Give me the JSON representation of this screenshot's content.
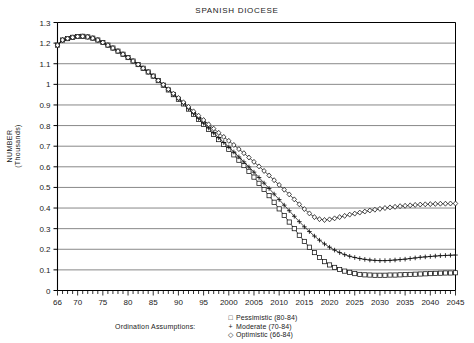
{
  "chart_data": {
    "type": "line",
    "title": "SPANISH DIOCESE",
    "xlabel": "",
    "ylabel": "NUMBER (Thousands)",
    "ylabel_line1": "NUMBER",
    "ylabel_line2": "(Thousands)",
    "grid": true,
    "legend_position": "below",
    "legend_title": "Ordination Assumptions:",
    "xlim": [
      1966,
      2045
    ],
    "ylim": [
      0,
      1.3
    ],
    "yticks": [
      "1.3",
      "1.2",
      "1.1",
      "1",
      "0.9",
      "0.8",
      "0.7",
      "0.6",
      "0.5",
      "0.4",
      "0.3",
      "0.2",
      "0.1",
      "0"
    ],
    "ytick_values": [
      1.3,
      1.2,
      1.1,
      1.0,
      0.9,
      0.8,
      0.7,
      0.6,
      0.5,
      0.4,
      0.3,
      0.2,
      0.1,
      0
    ],
    "xticks": [
      "66",
      "70",
      "75",
      "80",
      "85",
      "90",
      "95",
      "2000",
      "2005",
      "2010",
      "2015",
      "2020",
      "2025",
      "2030",
      "2035",
      "2040",
      "2045"
    ],
    "xtick_values": [
      1966,
      1970,
      1975,
      1980,
      1985,
      1990,
      1995,
      2000,
      2005,
      2010,
      2015,
      2020,
      2025,
      2030,
      2035,
      2040,
      2045
    ],
    "x": [
      1966,
      1967,
      1968,
      1969,
      1970,
      1971,
      1972,
      1973,
      1974,
      1975,
      1976,
      1977,
      1978,
      1979,
      1980,
      1981,
      1982,
      1983,
      1984,
      1985,
      1986,
      1987,
      1988,
      1989,
      1990,
      1991,
      1992,
      1993,
      1994,
      1995,
      1996,
      1997,
      1998,
      1999,
      2000,
      2001,
      2002,
      2003,
      2004,
      2005,
      2006,
      2007,
      2008,
      2009,
      2010,
      2011,
      2012,
      2013,
      2014,
      2015,
      2016,
      2017,
      2018,
      2019,
      2020,
      2021,
      2022,
      2023,
      2024,
      2025,
      2026,
      2027,
      2028,
      2029,
      2030,
      2031,
      2032,
      2033,
      2034,
      2035,
      2036,
      2037,
      2038,
      2039,
      2040,
      2041,
      2042,
      2043,
      2044,
      2045
    ],
    "series": [
      {
        "name": "Pessimistic (80-84)",
        "marker": "square",
        "values": [
          1.19,
          1.215,
          1.222,
          1.228,
          1.232,
          1.233,
          1.23,
          1.224,
          1.215,
          1.203,
          1.19,
          1.176,
          1.161,
          1.146,
          1.13,
          1.113,
          1.096,
          1.078,
          1.06,
          1.04,
          1.018,
          0.996,
          0.973,
          0.95,
          0.928,
          0.905,
          0.88,
          0.855,
          0.83,
          0.806,
          0.782,
          0.757,
          0.732,
          0.708,
          0.684,
          0.658,
          0.632,
          0.606,
          0.578,
          0.55,
          0.52,
          0.49,
          0.46,
          0.428,
          0.396,
          0.364,
          0.332,
          0.3,
          0.268,
          0.238,
          0.21,
          0.184,
          0.16,
          0.14,
          0.124,
          0.112,
          0.102,
          0.094,
          0.088,
          0.082,
          0.078,
          0.076,
          0.075,
          0.074,
          0.074,
          0.074,
          0.075,
          0.075,
          0.076,
          0.077,
          0.078,
          0.079,
          0.08,
          0.081,
          0.082,
          0.083,
          0.084,
          0.085,
          0.085,
          0.086
        ]
      },
      {
        "name": "Moderate (70-84)",
        "marker": "plus",
        "values": [
          1.19,
          1.215,
          1.222,
          1.228,
          1.232,
          1.233,
          1.23,
          1.224,
          1.215,
          1.203,
          1.19,
          1.176,
          1.161,
          1.146,
          1.13,
          1.113,
          1.096,
          1.078,
          1.06,
          1.04,
          1.018,
          0.996,
          0.973,
          0.95,
          0.928,
          0.906,
          0.882,
          0.858,
          0.834,
          0.811,
          0.788,
          0.764,
          0.741,
          0.718,
          0.696,
          0.672,
          0.648,
          0.624,
          0.599,
          0.574,
          0.548,
          0.521,
          0.495,
          0.468,
          0.441,
          0.414,
          0.387,
          0.36,
          0.334,
          0.309,
          0.286,
          0.264,
          0.244,
          0.226,
          0.21,
          0.196,
          0.184,
          0.174,
          0.166,
          0.16,
          0.155,
          0.151,
          0.148,
          0.146,
          0.145,
          0.145,
          0.146,
          0.148,
          0.15,
          0.152,
          0.155,
          0.158,
          0.161,
          0.163,
          0.165,
          0.167,
          0.169,
          0.17,
          0.171,
          0.172
        ]
      },
      {
        "name": "Optimistic (66-84)",
        "marker": "diamond",
        "values": [
          1.19,
          1.215,
          1.222,
          1.228,
          1.232,
          1.233,
          1.23,
          1.224,
          1.215,
          1.203,
          1.19,
          1.176,
          1.161,
          1.146,
          1.13,
          1.113,
          1.096,
          1.078,
          1.06,
          1.04,
          1.019,
          0.998,
          0.976,
          0.955,
          0.934,
          0.913,
          0.891,
          0.869,
          0.848,
          0.827,
          0.806,
          0.785,
          0.765,
          0.745,
          0.726,
          0.706,
          0.686,
          0.666,
          0.645,
          0.624,
          0.602,
          0.58,
          0.558,
          0.535,
          0.512,
          0.489,
          0.466,
          0.442,
          0.418,
          0.395,
          0.374,
          0.356,
          0.346,
          0.342,
          0.345,
          0.35,
          0.356,
          0.362,
          0.368,
          0.373,
          0.378,
          0.383,
          0.388,
          0.392,
          0.396,
          0.4,
          0.403,
          0.406,
          0.409,
          0.411,
          0.413,
          0.415,
          0.417,
          0.418,
          0.419,
          0.42,
          0.421,
          0.421,
          0.422,
          0.422
        ]
      }
    ],
    "optimistic_minimum": {
      "year": 2019,
      "value": 0.342
    },
    "colors": {
      "line": "#111111",
      "grid": "#555555",
      "axis": "#000000"
    }
  },
  "legend": {
    "title": "Ordination Assumptions:",
    "items": [
      {
        "symbol": "□",
        "label": "Pessimistic (80-84)"
      },
      {
        "symbol": "+",
        "label": "Moderate (70-84)"
      },
      {
        "symbol": "◇",
        "label": "Optimistic (66-84)"
      }
    ]
  }
}
